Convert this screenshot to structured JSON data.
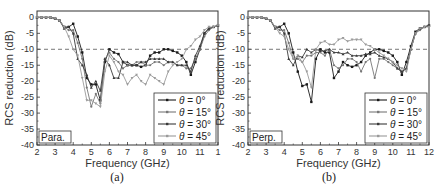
{
  "chart_data": [
    {
      "type": "line",
      "panel": "a",
      "caption": "(a)",
      "tag": "Para.",
      "xlabel": "Frequency (GHz)",
      "ylabel": "RCS reduction (dB)",
      "xlim": [
        2,
        12
      ],
      "ylim": [
        -40,
        2
      ],
      "xticks": [
        2,
        3,
        4,
        5,
        6,
        7,
        8,
        9,
        10,
        11,
        12
      ],
      "xtick_labels": [
        "2",
        "3",
        "4",
        "5",
        "6",
        "7",
        "8",
        "9",
        "10",
        "11",
        "1"
      ],
      "yticks": [
        0,
        -5,
        -10,
        -15,
        -20,
        -25,
        -30,
        -35,
        -40
      ],
      "ytick_labels": [
        "0",
        "-5",
        "-10",
        "-15",
        "-20",
        "-25",
        "-30",
        "-35",
        "-40"
      ],
      "reference_line": {
        "y": -10,
        "style": "dashed"
      },
      "legend_position": "lower right",
      "series": [
        {
          "name": "θ = 0°",
          "theta": "0°",
          "color": "#1a1a1a",
          "marker": "square",
          "x": [
            2,
            2.25,
            2.5,
            2.75,
            3,
            3.25,
            3.5,
            3.75,
            4,
            4.25,
            4.5,
            4.75,
            5,
            5.25,
            5.5,
            5.75,
            6,
            6.25,
            6.5,
            6.75,
            7,
            7.25,
            7.5,
            7.75,
            8,
            8.25,
            8.5,
            8.75,
            9,
            9.25,
            9.5,
            9.75,
            10,
            10.25,
            10.5,
            10.75,
            11,
            11.25,
            11.5,
            11.75,
            12
          ],
          "y": [
            0,
            0,
            0,
            0,
            -0.3,
            -1,
            -3,
            -3,
            -2,
            -6,
            -11,
            -19,
            -21,
            -21,
            -26,
            -14,
            -10,
            -11,
            -11.5,
            -14,
            -15,
            -15,
            -15,
            -15.5,
            -15,
            -12,
            -11,
            -11,
            -10,
            -10,
            -10.5,
            -11,
            -12,
            -14,
            -18,
            -14,
            -10,
            -5,
            -3.5,
            -3,
            -2.5
          ]
        },
        {
          "name": "θ = 15°",
          "theta": "15°",
          "color": "#777777",
          "marker": "circle",
          "x": [
            2,
            2.25,
            2.5,
            2.75,
            3,
            3.25,
            3.5,
            3.75,
            4,
            4.25,
            4.5,
            4.75,
            5,
            5.25,
            5.5,
            5.75,
            6,
            6.25,
            6.5,
            6.75,
            7,
            7.25,
            7.5,
            7.75,
            8,
            8.25,
            8.5,
            8.75,
            9,
            9.25,
            9.5,
            9.75,
            10,
            10.25,
            10.5,
            10.75,
            11,
            11.25,
            11.5,
            11.75,
            12
          ],
          "y": [
            0,
            0,
            0,
            0,
            -0.3,
            -1,
            -3,
            -4,
            -4,
            -8,
            -13,
            -22,
            -28,
            -24,
            -27,
            -13,
            -11,
            -13,
            -14,
            -16,
            -15,
            -15,
            -14,
            -14,
            -15,
            -15,
            -14,
            -14,
            -15,
            -14,
            -14,
            -15,
            -15,
            -16,
            -16,
            -13,
            -10,
            -6,
            -4,
            -3,
            -2.5
          ]
        },
        {
          "name": "θ = 30°",
          "theta": "30°",
          "color": "#3a3a3a",
          "marker": "triangle",
          "x": [
            2,
            2.25,
            2.5,
            2.75,
            3,
            3.25,
            3.5,
            3.75,
            4,
            4.25,
            4.5,
            4.75,
            5,
            5.25,
            5.5,
            5.75,
            6,
            6.25,
            6.5,
            6.75,
            7,
            7.25,
            7.5,
            7.75,
            8,
            8.25,
            8.5,
            8.75,
            9,
            9.25,
            9.5,
            9.75,
            10,
            10.25,
            10.5,
            10.75,
            11,
            11.25,
            11.5,
            11.75,
            12
          ],
          "y": [
            0,
            0,
            0,
            0,
            -0.3,
            -1,
            -3.5,
            -3,
            -5,
            -13,
            -15,
            -18,
            -22,
            -20,
            -23,
            -13,
            -15,
            -19,
            -19,
            -14,
            -14,
            -15,
            -15,
            -14,
            -14,
            -13,
            -13,
            -13,
            -13,
            -14,
            -14,
            -15,
            -15,
            -15,
            -17,
            -12,
            -9,
            -5,
            -3.5,
            -3,
            -2.5
          ]
        },
        {
          "name": "θ = 45°",
          "theta": "45°",
          "color": "#9a9a9a",
          "marker": "inverted-triangle",
          "x": [
            2,
            2.25,
            2.5,
            2.75,
            3,
            3.25,
            3.5,
            3.75,
            4,
            4.25,
            4.5,
            4.75,
            5,
            5.25,
            5.5,
            5.75,
            6,
            6.25,
            6.5,
            6.75,
            7,
            7.25,
            7.5,
            7.75,
            8,
            8.25,
            8.5,
            8.75,
            9,
            9.25,
            9.5,
            9.75,
            10,
            10.25,
            10.5,
            10.75,
            11,
            11.25,
            11.5,
            11.75,
            12
          ],
          "y": [
            0,
            0,
            0,
            0,
            -0.3,
            -1,
            -3,
            -6,
            -10,
            -12,
            -19,
            -26,
            -26,
            -27,
            -28,
            -17,
            -12,
            -14,
            -17,
            -18,
            -21,
            -19,
            -18,
            -20,
            -21,
            -18,
            -19,
            -20,
            -21,
            -17,
            -15,
            -14,
            -13,
            -10,
            -9,
            -7,
            -6,
            -4,
            -3,
            -3,
            -2.5
          ]
        }
      ]
    },
    {
      "type": "line",
      "panel": "b",
      "caption": "(b)",
      "tag": "Perp.",
      "xlabel": "Frequency (GHz)",
      "ylabel": "RCS reduction (dB)",
      "xlim": [
        2,
        12
      ],
      "ylim": [
        -40,
        2
      ],
      "xticks": [
        2,
        3,
        4,
        5,
        6,
        7,
        8,
        9,
        10,
        11,
        12
      ],
      "xtick_labels": [
        "2",
        "3",
        "4",
        "5",
        "6",
        "7",
        "8",
        "9",
        "10",
        "11",
        "12"
      ],
      "yticks": [
        0,
        -5,
        -10,
        -15,
        -20,
        -25,
        -30,
        -35,
        -40
      ],
      "ytick_labels": [
        "0",
        "-5",
        "-10",
        "-15",
        "-20",
        "-25",
        "-30",
        "-35",
        "-40"
      ],
      "reference_line": {
        "y": -10,
        "style": "dashed"
      },
      "legend_position": "lower right",
      "series": [
        {
          "name": "θ = 0°",
          "theta": "0°",
          "color": "#1a1a1a",
          "marker": "square",
          "x": [
            2,
            2.25,
            2.5,
            2.75,
            3,
            3.25,
            3.5,
            3.75,
            4,
            4.25,
            4.5,
            4.75,
            5,
            5.25,
            5.5,
            5.75,
            6,
            6.25,
            6.5,
            6.75,
            7,
            7.25,
            7.5,
            7.75,
            8,
            8.25,
            8.5,
            8.75,
            9,
            9.25,
            9.5,
            9.75,
            10,
            10.25,
            10.5,
            10.75,
            11,
            11.25,
            11.5,
            11.75,
            12
          ],
          "y": [
            0,
            0,
            0,
            0,
            -0.3,
            -1,
            -3,
            -3,
            -2,
            -5,
            -11,
            -17,
            -21.5,
            -21,
            -26.5,
            -13,
            -10,
            -11,
            -11,
            -19,
            -17,
            -14,
            -15,
            -15.5,
            -15,
            -14,
            -12,
            -11,
            -10,
            -10,
            -10.5,
            -11,
            -12,
            -14,
            -18,
            -14,
            -9,
            -4.5,
            -3.5,
            -3,
            -2.5
          ]
        },
        {
          "name": "θ = 15°",
          "theta": "15°",
          "color": "#777777",
          "marker": "circle",
          "x": [
            2,
            2.25,
            2.5,
            2.75,
            3,
            3.25,
            3.5,
            3.75,
            4,
            4.25,
            4.5,
            4.75,
            5,
            5.25,
            5.5,
            5.75,
            6,
            6.25,
            6.5,
            6.75,
            7,
            7.25,
            7.5,
            7.75,
            8,
            8.25,
            8.5,
            8.75,
            9,
            9.25,
            9.5,
            9.75,
            10,
            10.25,
            10.5,
            10.75,
            11,
            11.25,
            11.5,
            11.75,
            12
          ],
          "y": [
            0,
            0,
            0,
            0,
            -0.3,
            -1,
            -3,
            -4,
            -4,
            -8,
            -13,
            -13,
            -14,
            -12,
            -12,
            -11,
            -11,
            -12,
            -10,
            -15,
            -16,
            -15,
            -13,
            -13,
            -14,
            -17,
            -14,
            -13,
            -19,
            -13,
            -13,
            -14,
            -15,
            -16,
            -17,
            -16,
            -10,
            -5,
            -4,
            -3,
            -2.5
          ]
        },
        {
          "name": "θ = 30°",
          "theta": "30°",
          "color": "#3a3a3a",
          "marker": "triangle",
          "x": [
            2,
            2.25,
            2.5,
            2.75,
            3,
            3.25,
            3.5,
            3.75,
            4,
            4.25,
            4.5,
            4.75,
            5,
            5.25,
            5.5,
            5.75,
            6,
            6.25,
            6.5,
            6.75,
            7,
            7.25,
            7.5,
            7.75,
            8,
            8.25,
            8.5,
            8.75,
            9,
            9.25,
            9.5,
            9.75,
            10,
            10.25,
            10.5,
            10.75,
            11,
            11.25,
            11.5,
            11.75,
            12
          ],
          "y": [
            0,
            0,
            0,
            0,
            -0.3,
            -1,
            -3.5,
            -3,
            -5,
            -13,
            -15,
            -12,
            -12.5,
            -10,
            -11,
            -10,
            -10.5,
            -10.5,
            -10,
            -11,
            -11,
            -11.5,
            -11,
            -12,
            -12,
            -12,
            -11.5,
            -11.5,
            -11,
            -12,
            -12.5,
            -13,
            -14,
            -16,
            -17,
            -16,
            -10,
            -5,
            -3.5,
            -3,
            -2.5
          ]
        },
        {
          "name": "θ = 45°",
          "theta": "45°",
          "color": "#9a9a9a",
          "marker": "inverted-triangle",
          "x": [
            2,
            2.25,
            2.5,
            2.75,
            3,
            3.25,
            3.5,
            3.75,
            4,
            4.25,
            4.5,
            4.75,
            5,
            5.25,
            5.5,
            5.75,
            6,
            6.25,
            6.5,
            6.75,
            7,
            7.25,
            7.5,
            7.75,
            8,
            8.25,
            8.5,
            8.75,
            9,
            9.25,
            9.5,
            9.75,
            10,
            10.25,
            10.5,
            10.75,
            11,
            11.25,
            11.5,
            11.75,
            12
          ],
          "y": [
            0,
            0,
            0,
            0,
            -0.3,
            -1,
            -3,
            -5,
            -6,
            -10,
            -13,
            -12,
            -14,
            -17,
            -22,
            -10,
            -8,
            -7.5,
            -8.5,
            -8.5,
            -7,
            -6.5,
            -7.5,
            -7,
            -7,
            -7,
            -8.5,
            -9,
            -10,
            -11,
            -12,
            -13,
            -14,
            -15,
            -16,
            -17,
            -10,
            -5,
            -3.5,
            -3,
            -3
          ]
        }
      ]
    }
  ]
}
